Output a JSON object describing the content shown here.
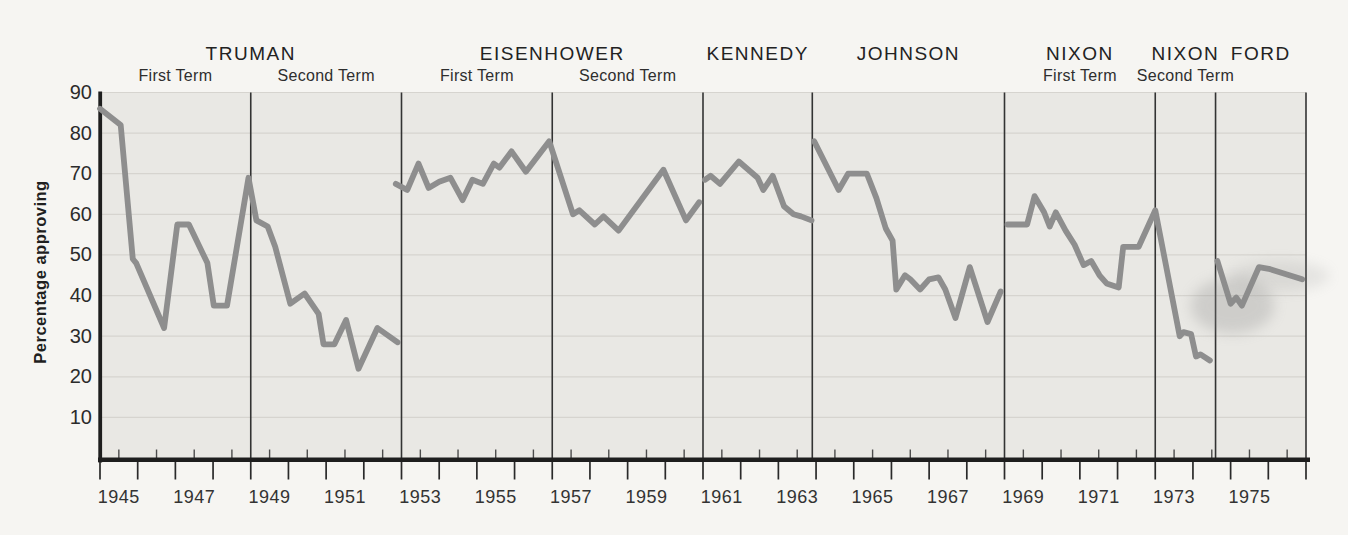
{
  "chart_data": {
    "type": "line",
    "title": "",
    "ylabel": "Percentage approving",
    "xlabel": "",
    "ylim": [
      0,
      90
    ],
    "xlim": [
      1945,
      1977
    ],
    "grid": true,
    "y_axis": {
      "tick_values": [
        90,
        80,
        70,
        60,
        50,
        40,
        30,
        20,
        10
      ],
      "tick_labels": [
        "90",
        "80",
        "70",
        "60",
        "50",
        "40",
        "30",
        "20",
        "10"
      ]
    },
    "x_axis": {
      "major_tick_every_year": true,
      "minor_tick_every_half_year": true,
      "tick_labels": [
        "1945",
        "1947",
        "1949",
        "1951",
        "1953",
        "1955",
        "1957",
        "1959",
        "1961",
        "1963",
        "1965",
        "1967",
        "1969",
        "1971",
        "1973",
        "1975"
      ],
      "label_center_years": [
        1945.5,
        1947.5,
        1949.5,
        1951.5,
        1953.5,
        1955.5,
        1957.5,
        1959.5,
        1961.5,
        1963.5,
        1965.5,
        1967.5,
        1969.5,
        1971.5,
        1973.5,
        1975.5
      ]
    },
    "term_dividers_years": [
      1949,
      1953,
      1957,
      1961,
      1963.9,
      1969,
      1973,
      1974.6,
      1977
    ],
    "presidents": [
      {
        "name": "TRUMAN",
        "terms": [
          {
            "label": "First Term",
            "start": 1945,
            "end": 1949
          },
          {
            "label": "Second Term",
            "start": 1949,
            "end": 1953
          }
        ]
      },
      {
        "name": "EISENHOWER",
        "terms": [
          {
            "label": "First Term",
            "start": 1953,
            "end": 1957
          },
          {
            "label": "Second Term",
            "start": 1957,
            "end": 1961
          }
        ]
      },
      {
        "name": "KENNEDY",
        "terms": [
          {
            "label": "",
            "start": 1961,
            "end": 1963.9
          }
        ]
      },
      {
        "name": "JOHNSON",
        "terms": [
          {
            "label": "",
            "start": 1963.9,
            "end": 1969
          }
        ]
      },
      {
        "name": "NIXON",
        "terms": [
          {
            "label": "First Term",
            "start": 1969,
            "end": 1973
          }
        ]
      },
      {
        "name": "NIXON",
        "terms": [
          {
            "label": "Second Term",
            "start": 1973,
            "end": 1974.6
          }
        ]
      },
      {
        "name": "FORD",
        "terms": [
          {
            "label": "",
            "start": 1974.6,
            "end": 1977
          }
        ]
      }
    ],
    "series": [
      {
        "name": "Truman approval",
        "points": [
          [
            1945.0,
            86
          ],
          [
            1945.55,
            82
          ],
          [
            1945.87,
            49
          ],
          [
            1945.96,
            48
          ],
          [
            1946.7,
            32
          ],
          [
            1947.05,
            57.5
          ],
          [
            1947.36,
            57.5
          ],
          [
            1947.85,
            48
          ],
          [
            1948.02,
            37.5
          ],
          [
            1948.37,
            37.5
          ],
          [
            1948.94,
            69
          ],
          [
            1949.15,
            58.5
          ],
          [
            1949.45,
            57
          ],
          [
            1949.65,
            52
          ],
          [
            1950.05,
            38
          ],
          [
            1950.43,
            40.5
          ],
          [
            1950.8,
            35.5
          ],
          [
            1950.93,
            28
          ],
          [
            1951.22,
            28
          ],
          [
            1951.53,
            34
          ],
          [
            1951.86,
            22
          ],
          [
            1952.36,
            32
          ],
          [
            1952.9,
            28.5
          ]
        ]
      },
      {
        "name": "Eisenhower approval",
        "points": [
          [
            1952.85,
            67.5
          ],
          [
            1953.15,
            66
          ],
          [
            1953.45,
            72.5
          ],
          [
            1953.72,
            66.5
          ],
          [
            1954.0,
            68
          ],
          [
            1954.3,
            69
          ],
          [
            1954.62,
            63.5
          ],
          [
            1954.88,
            68.5
          ],
          [
            1955.16,
            67.5
          ],
          [
            1955.45,
            72.5
          ],
          [
            1955.6,
            71.5
          ],
          [
            1955.92,
            75.5
          ],
          [
            1956.3,
            70.5
          ],
          [
            1956.92,
            78
          ],
          [
            1957.55,
            60
          ],
          [
            1957.72,
            61
          ],
          [
            1958.13,
            57.5
          ],
          [
            1958.36,
            59.5
          ],
          [
            1958.76,
            56
          ],
          [
            1959.95,
            71
          ],
          [
            1960.55,
            58.5
          ],
          [
            1960.9,
            63
          ]
        ]
      },
      {
        "name": "Kennedy approval",
        "points": [
          [
            1961.05,
            68.5
          ],
          [
            1961.2,
            69.5
          ],
          [
            1961.45,
            67.5
          ],
          [
            1961.95,
            73
          ],
          [
            1962.45,
            69
          ],
          [
            1962.6,
            66
          ],
          [
            1962.85,
            69.5
          ],
          [
            1963.15,
            62
          ],
          [
            1963.4,
            60
          ],
          [
            1963.6,
            59.5
          ],
          [
            1963.88,
            58.5
          ]
        ]
      },
      {
        "name": "Johnson approval",
        "points": [
          [
            1963.95,
            78
          ],
          [
            1964.6,
            66
          ],
          [
            1964.85,
            70
          ],
          [
            1965.35,
            70
          ],
          [
            1965.6,
            64
          ],
          [
            1965.85,
            56.5
          ],
          [
            1966.03,
            53.5
          ],
          [
            1966.13,
            41.5
          ],
          [
            1966.36,
            45
          ],
          [
            1966.5,
            44
          ],
          [
            1966.76,
            41.5
          ],
          [
            1967.0,
            44
          ],
          [
            1967.25,
            44.5
          ],
          [
            1967.43,
            41.5
          ],
          [
            1967.7,
            34.5
          ],
          [
            1968.08,
            47
          ],
          [
            1968.55,
            33.5
          ],
          [
            1968.9,
            41
          ]
        ]
      },
      {
        "name": "Nixon approval",
        "points": [
          [
            1969.08,
            57.5
          ],
          [
            1969.6,
            57.5
          ],
          [
            1969.8,
            64.5
          ],
          [
            1970.05,
            60.5
          ],
          [
            1970.2,
            57
          ],
          [
            1970.36,
            60.5
          ],
          [
            1970.62,
            56
          ],
          [
            1970.86,
            52.5
          ],
          [
            1971.1,
            47.5
          ],
          [
            1971.3,
            48.5
          ],
          [
            1971.52,
            45
          ],
          [
            1971.71,
            43
          ],
          [
            1972.03,
            42
          ],
          [
            1972.15,
            52
          ],
          [
            1972.56,
            52
          ],
          [
            1973.0,
            61
          ],
          [
            1973.65,
            30
          ],
          [
            1973.75,
            31
          ],
          [
            1973.95,
            30.5
          ],
          [
            1974.08,
            25
          ],
          [
            1974.2,
            25.5
          ],
          [
            1974.45,
            24
          ]
        ]
      },
      {
        "name": "Ford approval",
        "points": [
          [
            1974.65,
            48.5
          ],
          [
            1975.0,
            38
          ],
          [
            1975.15,
            39.5
          ],
          [
            1975.3,
            37.5
          ],
          [
            1975.75,
            47
          ],
          [
            1976.05,
            46.5
          ],
          [
            1976.9,
            44
          ]
        ]
      }
    ],
    "artifacts": [
      {
        "name": "print-smudge",
        "year": 1975.05,
        "value": 37.5,
        "rx": 42,
        "ry": 28,
        "opacity": 0.28
      },
      {
        "name": "print-smudge",
        "year": 1976.3,
        "value": 44.8,
        "rx": 50,
        "ry": 15,
        "opacity": 0.16
      }
    ],
    "colors": {
      "line": "#8e8e8e",
      "plot_background": "#e9e8e4",
      "page_background": "#f6f5f2",
      "gridline": "#d6d4cf",
      "axis": "#1e1e1e",
      "divider": "#333333",
      "text": "#2b2b2b"
    }
  }
}
